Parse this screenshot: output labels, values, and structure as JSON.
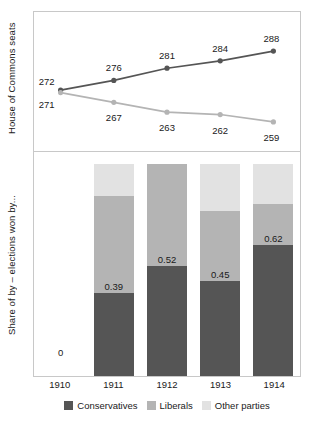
{
  "axis_titles": {
    "top": "House of Commons seats",
    "bottom": "Share of by – elections won by..."
  },
  "legend": [
    {
      "label": "Conservatives",
      "color": "#555555"
    },
    {
      "label": "Liberals",
      "color": "#b4b4b4"
    },
    {
      "label": "Other parties",
      "color": "#e2e2e2"
    }
  ],
  "xticks": [
    "1910",
    "1911",
    "1912",
    "1913",
    "1914"
  ],
  "bar_zero_label": "0",
  "chart_data": [
    {
      "type": "line",
      "title": "",
      "xlabel": "",
      "ylabel": "House of Commons seats",
      "x": [
        "1910",
        "1911",
        "1912",
        "1913",
        "1914"
      ],
      "ylim": [
        252,
        295
      ],
      "grid": false,
      "legend_position": "bottom",
      "series": [
        {
          "name": "Conservatives",
          "color": "#555555",
          "values": [
            272,
            276,
            281,
            284,
            288
          ],
          "labels": [
            "272",
            "276",
            "281",
            "284",
            "288"
          ]
        },
        {
          "name": "Liberals",
          "color": "#b4b4b4",
          "values": [
            271,
            267,
            263,
            262,
            259
          ],
          "labels": [
            "271",
            "267",
            "263",
            "262",
            "259"
          ]
        }
      ]
    },
    {
      "type": "bar",
      "stacked": true,
      "title": "",
      "xlabel": "",
      "ylabel": "Share of by – elections won by...",
      "categories": [
        "1910",
        "1911",
        "1912",
        "1913",
        "1914"
      ],
      "ylim": [
        0,
        1
      ],
      "grid": false,
      "legend_position": "bottom",
      "series": [
        {
          "name": "Conservatives",
          "color": "#555555",
          "values": [
            null,
            0.39,
            0.52,
            0.45,
            0.62
          ],
          "labels": [
            "",
            "0.39",
            "0.52",
            "0.45",
            "0.62"
          ]
        },
        {
          "name": "Liberals",
          "color": "#b4b4b4",
          "values": [
            null,
            0.46,
            0.48,
            0.33,
            0.19
          ]
        },
        {
          "name": "Other parties",
          "color": "#e2e2e2",
          "values": [
            null,
            0.15,
            0.0,
            0.22,
            0.19
          ]
        }
      ]
    }
  ]
}
